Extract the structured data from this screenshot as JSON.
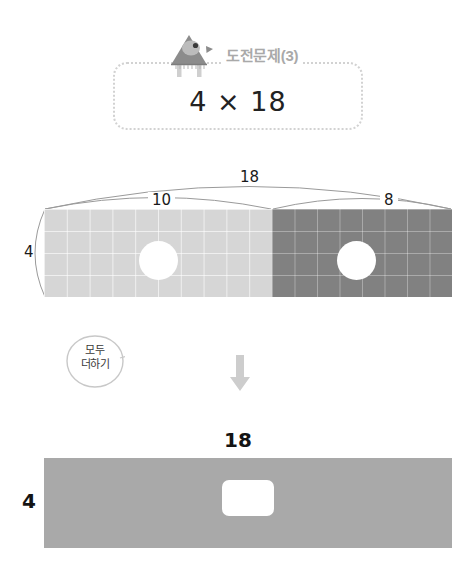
{
  "problem": {
    "title": "도전문제(3)",
    "equation": "4 × 18",
    "icon": "bird-triangle-icon"
  },
  "parts_diagram": {
    "total_width_label": "18",
    "left_part_label": "10",
    "right_part_label": "8",
    "height_label": "4",
    "left_color": "#d6d6d6",
    "right_color": "#818181"
  },
  "hint": {
    "text_line1": "모두",
    "text_line2": "더하기",
    "arrow": "down-arrow-icon"
  },
  "result_diagram": {
    "width_label": "18",
    "height_label": "4",
    "answer_value": "",
    "answer_placeholder": "",
    "color": "#a9a9a9"
  }
}
